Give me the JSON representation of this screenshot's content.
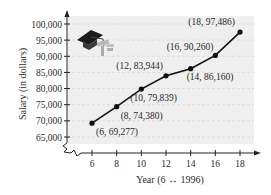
{
  "chart_data": {
    "type": "line",
    "title": "",
    "xlabel": "Year (6 ↔ 1996)",
    "ylabel": "Salary (in dollars)",
    "x": [
      6,
      8,
      10,
      12,
      14,
      16,
      18
    ],
    "series": [
      {
        "name": "Salary",
        "values": [
          69277,
          74380,
          79839,
          83944,
          86160,
          90260,
          97486
        ]
      }
    ],
    "x_ticks": [
      "6",
      "8",
      "10",
      "12",
      "14",
      "16",
      "18"
    ],
    "y_ticks": [
      "65,000",
      "70,000",
      "75,000",
      "80,000",
      "85,000",
      "90,000",
      "95,000",
      "100,000"
    ],
    "xlim": [
      6,
      18
    ],
    "ylim": [
      65000,
      100000
    ],
    "grid": "horizontal dashed",
    "axis_break": "y-axis below 65,000",
    "annotations": [
      "(6, 69,277)",
      "(8, 74,380)",
      "(10, 79,839)",
      "(12, 83,944)",
      "(14, 86,160)",
      "(16, 90,260)",
      "(18, 97,486)"
    ],
    "decoration": "graduation-cap-icon"
  },
  "colors": {
    "plot_background": "#efefef",
    "line": "#111111",
    "grid": "#d8d8d8",
    "text": "#2a2a2a"
  }
}
